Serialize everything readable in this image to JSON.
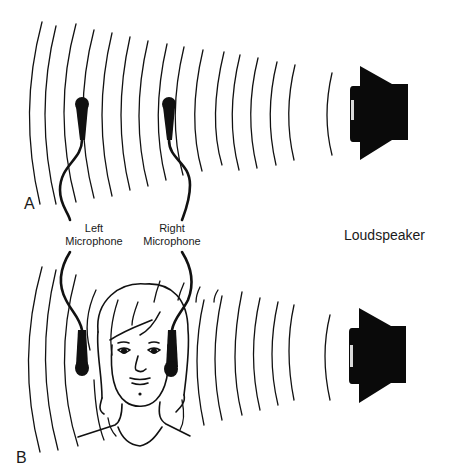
{
  "figure": {
    "panels": [
      {
        "id": "A",
        "letter": "A",
        "description": "Two spaced microphones on stands in front of a loudspeaker",
        "microphones": [
          "Left",
          "Right"
        ],
        "source": "Loudspeaker"
      },
      {
        "id": "B",
        "letter": "B",
        "description": "Microphones placed at the ears of a person (binaural) facing a loudspeaker",
        "microphones": [
          "Left",
          "Right"
        ],
        "source": "Loudspeaker"
      }
    ],
    "labels": {
      "left_mic_line1": "Left",
      "left_mic_line2": "Microphone",
      "right_mic_line1": "Right",
      "right_mic_line2": "Microphone",
      "loudspeaker": "Loudspeaker",
      "panel_a": "A",
      "panel_b": "B"
    },
    "colors": {
      "ink": "#111111",
      "background": "#ffffff"
    },
    "icons": {
      "microphone": "microphone-icon",
      "loudspeaker": "loudspeaker-icon",
      "sound_wave": "sound-wave-arcs",
      "head": "human-head-illustration"
    }
  }
}
